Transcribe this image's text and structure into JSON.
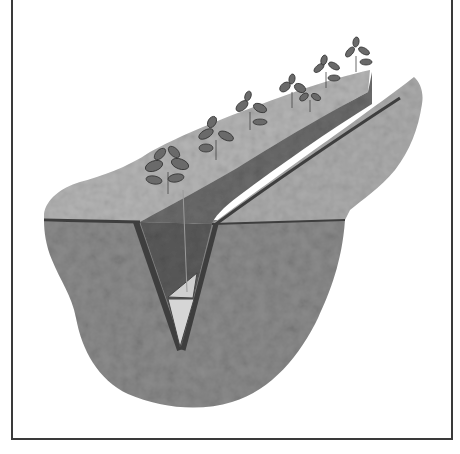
{
  "figure": {
    "style": "grayscale stippled illustration in a thin rectangular frame",
    "elements": {
      "soil_block": "Wedge of soil cut away to show the cross-section",
      "trench": "V-shaped slit trench cut into the ground",
      "seedlings": "Row of small leafy seedlings planted along the trench edge",
      "seedling_count": 7,
      "triangle_marker": "Light triangular wedge at the bottom of the trench"
    },
    "colors": {
      "frame": "#3a3a3a",
      "surface_light": "#b8b8b8",
      "soil_mid": "#8a8a8a",
      "soil_dark": "#5a5a5a",
      "trench_wall": "#6e6e6e",
      "leaf": "#6a6a6a",
      "wedge_light": "#d8d8d8"
    }
  }
}
